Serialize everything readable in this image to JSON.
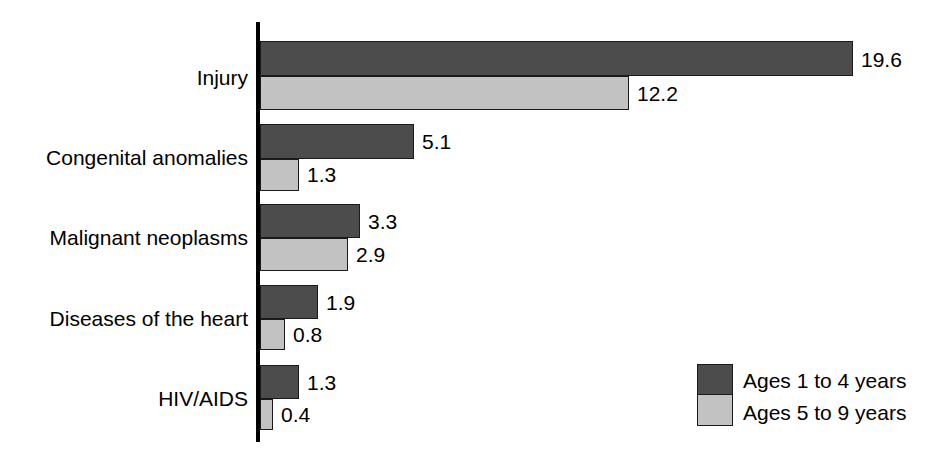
{
  "chart_data": {
    "type": "bar",
    "orientation": "horizontal",
    "title": "",
    "subtitle": "",
    "xlabel": "",
    "ylabel": "",
    "grid": false,
    "axis_visible": {
      "x": false,
      "y": true
    },
    "xlim": [
      0,
      19.6
    ],
    "categories": [
      "Injury",
      "Congenital anomalies",
      "Malignant neoplasms",
      "Diseases of the heart",
      "HIV/AIDS"
    ],
    "series": [
      {
        "name": "Ages 1 to 4 years",
        "color": "#4c4c4c",
        "values": [
          19.6,
          5.1,
          3.3,
          1.9,
          1.3
        ],
        "labels": [
          "19.6",
          "5.1",
          "3.3",
          "1.9",
          "1.3"
        ]
      },
      {
        "name": "Ages 5 to 9 years",
        "color": "#c2c2c2",
        "values": [
          12.2,
          1.3,
          2.9,
          0.8,
          0.4
        ],
        "labels": [
          "12.2",
          "1.3",
          "2.9",
          "0.8",
          "0.4"
        ]
      }
    ],
    "legend": {
      "position": "bottom-right",
      "entries": [
        {
          "label": "Ages 1 to 4 years",
          "color": "#4c4c4c"
        },
        {
          "label": "Ages 5 to 9 years",
          "color": "#c2c2c2"
        }
      ]
    },
    "annotations": []
  },
  "colors": {
    "series_dark": "#4c4c4c",
    "series_light": "#c2c2c2",
    "axis": "#000000",
    "text": "#000000",
    "background": "#ffffff"
  }
}
